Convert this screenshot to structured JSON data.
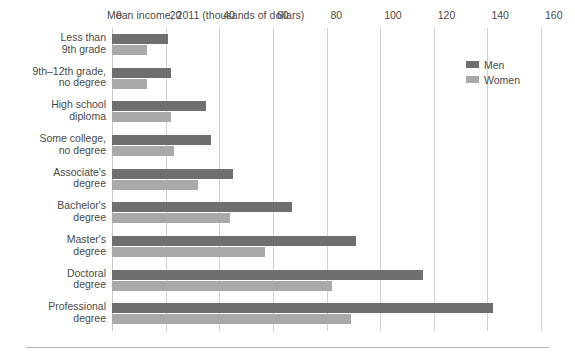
{
  "chart_data": {
    "type": "bar",
    "orientation": "horizontal",
    "title": "Mean income, 2011 (thousands of dollars)",
    "xlabel": "",
    "ylabel": "",
    "xlim": [
      0,
      160
    ],
    "xticks": [
      0,
      20,
      40,
      60,
      80,
      100,
      120,
      140,
      160
    ],
    "xtick_labels": [
      "0",
      "20",
      "40",
      "60",
      "80",
      "100",
      "120",
      "140",
      "160"
    ],
    "grid": true,
    "grid_axis": "x",
    "legend_position": "top-right",
    "categories": [
      "Less than 9th grade",
      "9th–12th grade, no degree",
      "High school diploma",
      "Some college, no degree",
      "Associate's degree",
      "Bachelor's degree",
      "Master's degree",
      "Doctoral degree",
      "Professional degree"
    ],
    "category_lines": [
      [
        "Less than",
        "9th grade"
      ],
      [
        "9th–12th grade,",
        "no degree"
      ],
      [
        "High school",
        "diploma"
      ],
      [
        "Some college,",
        "no degree"
      ],
      [
        "Associate's",
        "degree"
      ],
      [
        "Bachelor's",
        "degree"
      ],
      [
        "Master's",
        "degree"
      ],
      [
        "Doctoral",
        "degree"
      ],
      [
        "Professional",
        "degree"
      ]
    ],
    "series": [
      {
        "name": "Men",
        "color": "#6f6f6f",
        "values": [
          21,
          22,
          35,
          37,
          45,
          67,
          91,
          116,
          142
        ]
      },
      {
        "name": "Women",
        "color": "#a9a9a9",
        "values": [
          13,
          13,
          22,
          23,
          32,
          44,
          57,
          82,
          89
        ]
      }
    ]
  },
  "legend": {
    "items": [
      {
        "label": "Men",
        "color": "#6f6f6f"
      },
      {
        "label": "Women",
        "color": "#a9a9a9"
      }
    ]
  }
}
